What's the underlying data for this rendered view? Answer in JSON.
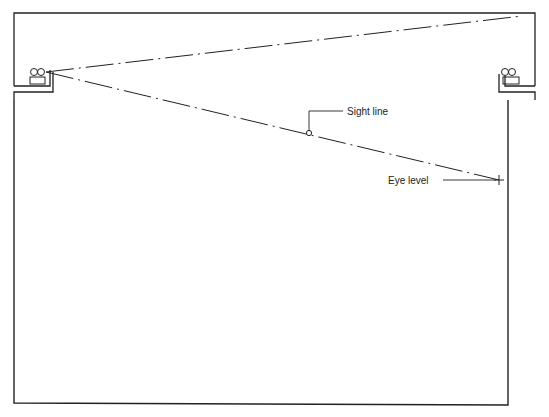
{
  "diagram": {
    "labels": {
      "sight_line": "Sight line",
      "eye_level": "Eye level"
    },
    "colors": {
      "stroke": "#222222",
      "background": "#ffffff"
    }
  }
}
